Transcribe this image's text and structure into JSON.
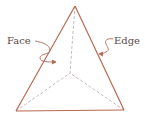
{
  "diagram": {
    "labels": {
      "face": "Face",
      "edge": "Edge"
    },
    "vertices": {
      "apex": [
        75,
        6
      ],
      "bottom_left": [
        16,
        111
      ],
      "bottom_right": [
        124,
        110
      ],
      "back_center": [
        70,
        73
      ]
    },
    "colors": {
      "edge_solid": "#b86a52",
      "edge_hidden": "#b8a8a4",
      "arrow": "#b06a58",
      "text": "#5a4a44"
    }
  }
}
